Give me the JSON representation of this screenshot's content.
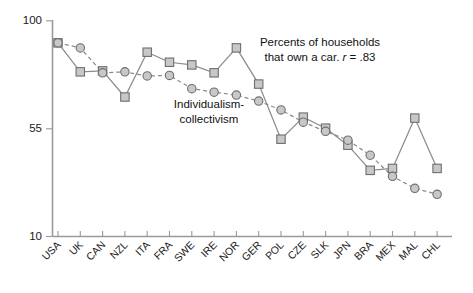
{
  "chart_data": {
    "type": "line",
    "title": "",
    "subtitle": "",
    "xlabel": "",
    "ylabel": "",
    "ylim": [
      10,
      100
    ],
    "yticks": [
      10,
      55,
      100
    ],
    "ytick_labels": [
      "10",
      "55",
      "100"
    ],
    "grid": false,
    "legend_position": "inline-annotations",
    "categories": [
      "USA",
      "UK",
      "CAN",
      "NZL",
      "ITA",
      "FRA",
      "SWE",
      "IRE",
      "NOR",
      "GER",
      "POL",
      "CZE",
      "SLK",
      "JPN",
      "BRA",
      "MEX",
      "MAL",
      "CHL"
    ],
    "series": [
      {
        "name": "Percents of households that own a car",
        "marker": "square",
        "linestyle": "solid",
        "values": [
          90.8,
          78.7,
          79.1,
          68.2,
          86.9,
          82.7,
          81.6,
          78.3,
          88.7,
          73.6,
          50.6,
          59.8,
          55.2,
          48.1,
          37.6,
          38.4,
          59.4,
          38.4
        ]
      },
      {
        "name": "Individualism-collectivism",
        "marker": "circle",
        "linestyle": "dashed",
        "values": [
          90.8,
          88.7,
          78.3,
          78.7,
          77.0,
          77.2,
          71.7,
          70.2,
          69.0,
          66.5,
          62.8,
          57.7,
          53.9,
          50.2,
          43.9,
          35.1,
          30.1,
          27.6
        ]
      }
    ],
    "annotations": [
      {
        "name": "car-ownership-annotation",
        "line1": "Percents of households",
        "line2_pre": "that own a car. ",
        "line2_ital": "r",
        "line2_post": " = .83",
        "x": 320,
        "y": 46
      },
      {
        "name": "individualism-annotation",
        "line1": "Individualism-",
        "line2": "collectivism",
        "x": 209,
        "y": 108
      }
    ]
  },
  "axes": {
    "y_axis_label": "",
    "x_axis_label": ""
  }
}
